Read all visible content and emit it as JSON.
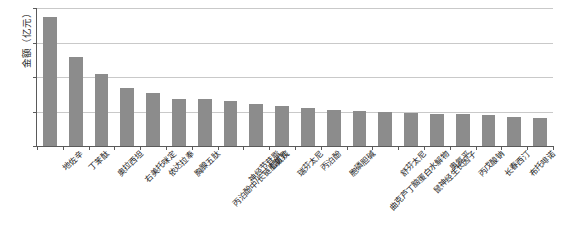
{
  "chart_data": {
    "type": "bar",
    "title": "",
    "subtitle": "",
    "xlabel": "",
    "ylabel": "金额（亿元）",
    "ylim": [
      0,
      40
    ],
    "yticks": [
      0,
      10,
      20,
      30,
      40
    ],
    "grid": true,
    "legend": false,
    "orientation": "vertical",
    "bar_color": "#8c8c8c",
    "categories": [
      "地佐辛",
      "丁苯酞",
      "奥拉西坦",
      "右美托咪定",
      "依达拉奉",
      "胸腺五肽",
      "丙泊酚中/长链脂肪乳",
      "神经节苷脂",
      "七氟烷",
      "瑞芬太尼",
      "丙泊酚",
      "胞磷胆碱",
      "曲克芦丁脑蛋白水解物",
      "舒芬太尼",
      "鼠神经生长因子",
      "奥氮平",
      "丙戊酸钠",
      "长春西汀",
      "布托啡诺",
      "小牛血清去蛋白"
    ],
    "values": [
      37.3,
      25.8,
      21.0,
      16.8,
      15.3,
      13.7,
      13.5,
      13.1,
      12.3,
      11.6,
      11.0,
      10.4,
      10.2,
      9.9,
      9.6,
      9.4,
      9.2,
      9.0,
      8.5,
      8.0
    ]
  },
  "axis": {
    "y_title": "金额（亿元）",
    "y_tick_labels": [
      "40",
      "30",
      "20",
      "10",
      "0"
    ]
  },
  "colors": {
    "bar": "#8c8c8c",
    "gridline": "#c9c9c9",
    "axis": "#5a5a5a",
    "text": "#1c1c1c",
    "background": "#ffffff"
  }
}
